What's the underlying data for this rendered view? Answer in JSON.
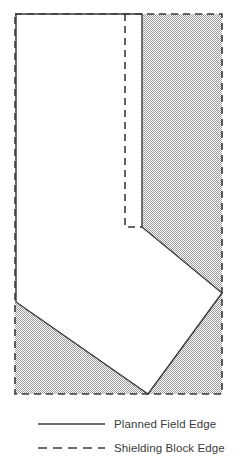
{
  "figure": {
    "name": "planned-field-and-shielding-block-diagram",
    "background_color": "#ffffff",
    "line_color": "#3b3b3b",
    "shaded_fill_color": "#d7d7d7",
    "shaded_fill_description": "fine checkerboard dither, light gray",
    "unshaded_fill_color": "#ffffff"
  },
  "diagram": {
    "canvas": {
      "width": 240,
      "height": 463
    },
    "planned_field": {
      "label": "Planned Field Edge",
      "style": "solid",
      "stroke_color": "#3b3b3b",
      "stroke_width": 1.4,
      "fill": "#ffffff",
      "vertices": [
        [
          16,
          14
        ],
        [
          142,
          14
        ],
        [
          142,
          227
        ],
        [
          222,
          293
        ],
        [
          148,
          394
        ],
        [
          16,
          302
        ]
      ]
    },
    "shielding_block": {
      "label": "Shielding Block Edge",
      "style": "dashed",
      "stroke_color": "#3b3b3b",
      "stroke_width": 1.6,
      "dash_pattern": "7,5",
      "fill": "#d7d7d7",
      "vertices": [
        [
          15,
          14
        ],
        [
          222,
          14
        ],
        [
          222,
          394
        ],
        [
          15,
          394
        ]
      ],
      "inner_notch_vertices": [
        [
          125,
          14
        ],
        [
          125,
          227
        ],
        [
          142,
          227
        ]
      ]
    }
  },
  "legend": {
    "name": "figure-legend",
    "entries": [
      {
        "label": "Planned Field Edge",
        "swatch_style": "solid",
        "swatch_name": "solid-line-swatch",
        "color": "#3b3b3b",
        "swatch_x1": 38,
        "swatch_x2": 105,
        "swatch_y": 424,
        "text_x": 114,
        "text_y": 428
      },
      {
        "label": "Shielding Block Edge",
        "swatch_style": "dashed",
        "swatch_name": "dashed-line-swatch",
        "color": "#3b3b3b",
        "swatch_x1": 38,
        "swatch_x2": 105,
        "swatch_y": 448,
        "text_x": 114,
        "text_y": 452
      }
    ]
  },
  "chart_data": {
    "type": "diagram",
    "title": "",
    "xlabel": "",
    "ylabel": "",
    "series": [
      {
        "name": "Planned Field Edge",
        "style": "solid",
        "closed": true,
        "points": [
          [
            16,
            14
          ],
          [
            142,
            14
          ],
          [
            142,
            227
          ],
          [
            222,
            293
          ],
          [
            148,
            394
          ],
          [
            16,
            302
          ]
        ]
      },
      {
        "name": "Shielding Block Edge",
        "style": "dashed",
        "closed": true,
        "points": [
          [
            15,
            14
          ],
          [
            222,
            14
          ],
          [
            222,
            394
          ],
          [
            15,
            394
          ]
        ]
      },
      {
        "name": "Shielding Block Edge Inner Notch",
        "style": "dashed",
        "closed": false,
        "points": [
          [
            125,
            14
          ],
          [
            125,
            227
          ],
          [
            142,
            227
          ]
        ]
      }
    ],
    "legend_entries": [
      "Planned Field Edge",
      "Shielding Block Edge"
    ],
    "legend_position": "bottom-left",
    "grid": false,
    "axis_visible": false
  }
}
